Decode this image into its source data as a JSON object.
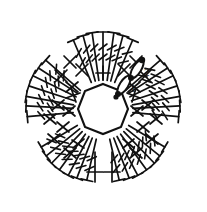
{
  "figure": {
    "type": "crochet-stitch-diagram",
    "background_color": "#ffffff",
    "ink_color": "#111111",
    "width": 207,
    "height": 212
  },
  "center_ring": {
    "name": "magic-ring-octagon",
    "shape": "octagon",
    "sides": 8,
    "center_x": 103,
    "center_y": 110,
    "radius": 26,
    "rotation_deg": 22
  },
  "start_markers": {
    "label_1": "1",
    "label_2": "2",
    "count": 2,
    "description": "starting chain stitches with slip knot dots"
  },
  "petals": {
    "count": 5,
    "stitches_per_petal": 7,
    "stitch_type": "double-treble",
    "hatches_per_stitch": 2,
    "angles_deg": [
      -90,
      -18,
      54,
      126,
      198
    ],
    "inner_radius": 30,
    "outer_radius": 78,
    "spread_deg": 46
  },
  "connector_stitches": {
    "x_symbol": "×",
    "plus_symbol": "+",
    "x_count": 20,
    "plus_count": 10,
    "description": "chain and single crochet symbols between petals"
  },
  "legend": {
    "ring_label": "center ring",
    "petal_label": "petal fan",
    "start_label": "start"
  }
}
